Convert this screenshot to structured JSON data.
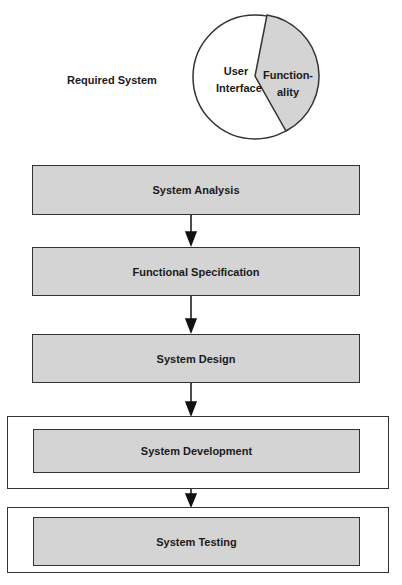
{
  "title": "Required System",
  "pie": {
    "slices": [
      {
        "label_line1": "User",
        "label_line2": "Interface",
        "fill": "#ffffff"
      },
      {
        "label_line1": "Function-",
        "label_line2": "ality",
        "fill": "#d4d4d4"
      }
    ]
  },
  "steps": [
    {
      "label": "System Analysis"
    },
    {
      "label": "Functional Specification"
    },
    {
      "label": "System Design"
    },
    {
      "label": "System Development"
    },
    {
      "label": "System Testing"
    }
  ]
}
